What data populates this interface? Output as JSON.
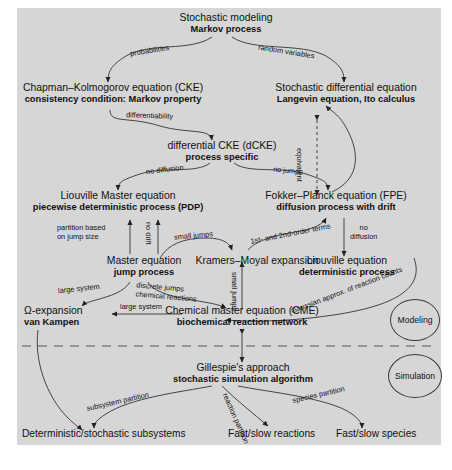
{
  "figure": {
    "background_color": "#d6d6d6",
    "page_color": "#ffffff",
    "divider": "dashed horizontal separator between Modeling and Simulation sections"
  },
  "sections": {
    "modeling_label": "Modeling",
    "simulation_label": "Simulation"
  },
  "nodes": {
    "stochastic_modeling": {
      "title": "Stochastic modeling",
      "subtitle": "Markov process"
    },
    "cke": {
      "title": "Chapman–Kolmogorov equation (CKE)",
      "subtitle": "consistency condition: Markov property"
    },
    "sde": {
      "title": "Stochastic differential equation",
      "subtitle": "Langevin equation, Ito calculus"
    },
    "dcke": {
      "title": "differential CKE (dCKE)",
      "subtitle": "process specific"
    },
    "liouville_master": {
      "title": "Liouville Master equation",
      "subtitle": "piecewise deterministic process (PDP)"
    },
    "fpe": {
      "title": "Fokker–Planck equation (FPE)",
      "subtitle": "diffusion process with drift"
    },
    "master_equation": {
      "title": "Master equation",
      "subtitle": "jump process"
    },
    "kramers_moyal": {
      "title": "Kramers–Moyal expansion",
      "subtitle": ""
    },
    "liouville_equation": {
      "title": "Liouville equation",
      "subtitle": "deterministic process"
    },
    "omega_expansion": {
      "title": "Ω-expansion",
      "subtitle": "van Kampen"
    },
    "cme": {
      "title": "Chemical master equation (CME)",
      "subtitle": "biochemical reaction network"
    },
    "gillespie": {
      "title": "Gillespie's approach",
      "subtitle": "stochastic simulation algorithm"
    },
    "det_stoch_subsystems": {
      "title": "Deterministic/stochastic subsystems",
      "subtitle": ""
    },
    "fast_slow_reactions": {
      "title": "Fast/slow reactions",
      "subtitle": ""
    },
    "fast_slow_species": {
      "title": "Fast/slow species",
      "subtitle": ""
    }
  },
  "edge_labels": {
    "probabilities": "probabilities",
    "random_variables": "random variables",
    "differentiability": "differentiability",
    "equivalent": "equivalent",
    "no_diffusion_top": "no diffusion",
    "no_jumps": "no jumps",
    "partition_based": "partition based",
    "on_jump_size": "on jump size",
    "no_drift": "no drift",
    "small_jumps_left": "small jumps",
    "first_second_order": "1st- and 2nd-order terms",
    "no_right": "no",
    "diffusion_right": "diffusion",
    "small_jumps_vertical": "small jumps",
    "large_system_left": "large system",
    "discrete_jumps": "discrete jumps",
    "chemical_reactions": "chemical reactions",
    "large_system_arrow": "large system",
    "gaussian_approx": "Gaussian approx. of reaction counts",
    "subsystem_partition": "subsystem partition",
    "reaction_partition": "reaction partition",
    "species_partition": "species partition"
  }
}
